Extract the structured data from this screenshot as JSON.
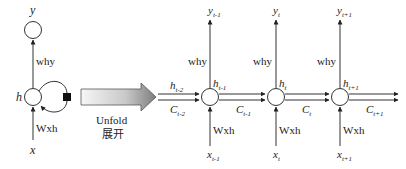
{
  "folded": {
    "output_label": "y",
    "hidden_label": "h",
    "input_label": "x",
    "weight_out": "why",
    "weight_in": "Wxh"
  },
  "unfold": {
    "label_en": "Unfold",
    "label_zh": "展开"
  },
  "incoming": {
    "h_label": "h",
    "h_sub": "t-2",
    "c_label": "C",
    "c_sub": "t-2"
  },
  "steps": [
    {
      "y": "y",
      "y_sub": "t-1",
      "h": "h",
      "h_sub": "t-1",
      "c": "C",
      "c_sub": "t-1",
      "x": "x",
      "x_sub": "t-1",
      "why": "why",
      "wxh": "Wxh"
    },
    {
      "y": "y",
      "y_sub": "t",
      "h": "h",
      "h_sub": "t",
      "c": "C",
      "c_sub": "t",
      "x": "x",
      "x_sub": "t",
      "why": "why",
      "wxh": "Wxh"
    },
    {
      "y": "y",
      "y_sub": "t+1",
      "h": "h",
      "h_sub": "t+1",
      "c": "C",
      "c_sub": "t+1",
      "x": "x",
      "x_sub": "t+1",
      "why": "why",
      "wxh": "Wxh"
    }
  ],
  "colors": {
    "stroke": "#333333",
    "arrow_fill_light": "#f4f4f4",
    "arrow_fill_dark": "#8a8a8a"
  }
}
